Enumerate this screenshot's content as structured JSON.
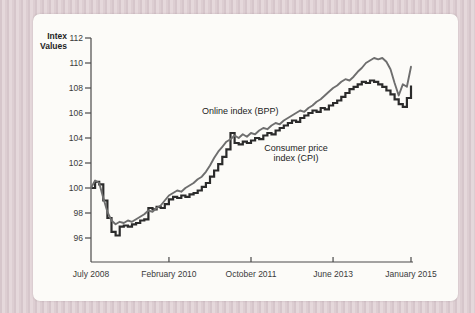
{
  "palette": {
    "page_background": "#decfd3",
    "card_background": "#fcfbf8",
    "axis_color": "#4a4a4a",
    "bpp_line_color": "#6e6e6e",
    "cpi_line_color": "#2b2b2b",
    "text_color": "#2e2e2e"
  },
  "axis_title": {
    "line1": "Intex",
    "line2": "Values"
  },
  "annotations": {
    "bpp_label": "Online index (BPP)",
    "cpi_label_line1": "Consumer price",
    "cpi_label_line2": "index (CPI)"
  },
  "chart_data": {
    "type": "line",
    "title": "",
    "xlabel": "",
    "ylabel": "Intex Values",
    "grid": false,
    "legend_position": "inline-annotations",
    "ylim": [
      94,
      112.5
    ],
    "y_ticks": [
      96,
      98,
      100,
      102,
      104,
      106,
      108,
      110,
      112
    ],
    "x_tick_labels": [
      "July 2008",
      "February 2010",
      "October 2011",
      "June 2013",
      "January 2015"
    ],
    "x_tick_months": [
      0,
      19,
      39,
      59,
      78
    ],
    "months_total": 78,
    "x_range_note": "monthly points, month 0 = July 2008, month 78 = January 2015",
    "series": [
      {
        "name": "Online index (BPP)",
        "style": "linear",
        "color": "#6e6e6e",
        "values": [
          100.0,
          100.6,
          100.4,
          99.2,
          98.1,
          97.4,
          97.1,
          97.3,
          97.2,
          97.4,
          97.3,
          97.5,
          97.7,
          97.9,
          98.2,
          98.1,
          98.4,
          98.6,
          99.0,
          99.4,
          99.6,
          99.8,
          99.7,
          100.0,
          100.2,
          100.4,
          100.7,
          100.9,
          101.3,
          101.8,
          102.4,
          102.9,
          103.3,
          103.7,
          103.9,
          104.2,
          104.0,
          104.3,
          104.1,
          104.4,
          104.3,
          104.6,
          104.8,
          104.7,
          105.0,
          105.2,
          105.1,
          105.4,
          105.6,
          105.8,
          106.0,
          106.2,
          106.1,
          106.4,
          106.6,
          106.9,
          107.1,
          107.4,
          107.7,
          108.0,
          108.2,
          108.5,
          108.7,
          108.6,
          108.9,
          109.3,
          109.6,
          110.0,
          110.2,
          110.4,
          110.3,
          110.4,
          110.1,
          109.5,
          108.4,
          107.4,
          108.3,
          108.1,
          109.7
        ]
      },
      {
        "name": "Consumer price index (CPI)",
        "style": "step",
        "color": "#2b2b2b",
        "values": [
          100.0,
          100.5,
          100.3,
          99.0,
          97.6,
          96.5,
          96.2,
          96.9,
          97.0,
          96.9,
          97.1,
          97.2,
          97.4,
          97.5,
          98.4,
          98.3,
          98.5,
          98.4,
          98.7,
          99.1,
          99.3,
          99.2,
          99.4,
          99.3,
          99.5,
          99.6,
          99.8,
          100.1,
          100.4,
          100.9,
          101.4,
          101.9,
          102.5,
          103.1,
          104.4,
          103.6,
          103.5,
          103.7,
          103.6,
          103.8,
          104.0,
          103.9,
          104.2,
          104.4,
          104.3,
          104.6,
          104.8,
          105.0,
          105.2,
          105.4,
          105.3,
          105.6,
          105.8,
          106.0,
          106.2,
          106.1,
          106.4,
          106.3,
          106.6,
          106.8,
          107.0,
          107.3,
          107.6,
          107.9,
          108.1,
          108.3,
          108.5,
          108.4,
          108.6,
          108.5,
          108.3,
          108.1,
          107.8,
          107.5,
          107.1,
          106.7,
          106.5,
          107.2,
          108.2
        ]
      }
    ]
  }
}
